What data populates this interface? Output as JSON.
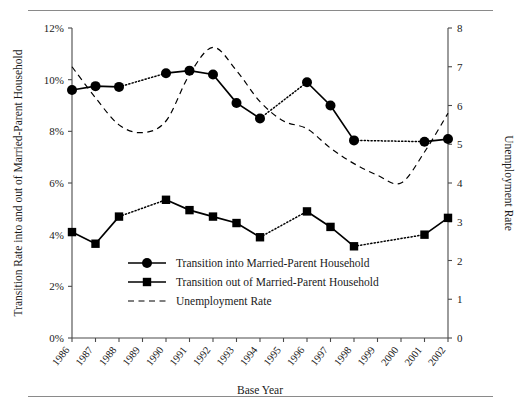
{
  "figure": {
    "has_top_rule": true,
    "has_bottom_rule": true
  },
  "chart_data": {
    "type": "line",
    "title": "",
    "xlabel": "Base Year",
    "ylabel": "Transition Rate into and out of Married-Parent Household",
    "y2label": "Unemployment Rate",
    "categories": [
      "1986",
      "1987",
      "1988",
      "1989",
      "1990",
      "1991",
      "1992",
      "1993",
      "1994",
      "1995",
      "1996",
      "1997",
      "1998",
      "1999",
      "2000",
      "2001",
      "2002"
    ],
    "ylim": [
      0,
      12
    ],
    "yticks": [
      0,
      2,
      4,
      6,
      8,
      10,
      12
    ],
    "ytick_labels": [
      "0%",
      "2%",
      "4%",
      "6%",
      "8%",
      "10%",
      "12%"
    ],
    "y2lim": [
      0,
      8
    ],
    "y2ticks": [
      0,
      1,
      2,
      3,
      4,
      5,
      6,
      7,
      8
    ],
    "y2tick_labels": [
      "0",
      "1",
      "2",
      "3",
      "4",
      "5",
      "6",
      "7",
      "8"
    ],
    "grid": false,
    "legend_position": "inside-lower-center",
    "series": [
      {
        "name": "Transition into Married-Parent Household",
        "axis": "left",
        "marker": "circle",
        "line": "solid",
        "values": [
          9.6,
          9.75,
          9.72,
          null,
          10.25,
          10.35,
          10.2,
          9.1,
          8.5,
          null,
          9.9,
          9.0,
          7.65,
          null,
          null,
          7.6,
          7.7
        ],
        "interpolated_gaps": [
          [
            "1988",
            "1990"
          ],
          [
            "1994",
            "1996"
          ],
          [
            "1998",
            "2001"
          ]
        ]
      },
      {
        "name": "Transition out of Married-Parent Household",
        "axis": "left",
        "marker": "square",
        "line": "solid",
        "values": [
          4.1,
          3.65,
          4.7,
          null,
          5.35,
          4.95,
          4.7,
          4.45,
          3.9,
          null,
          4.9,
          4.3,
          3.55,
          null,
          null,
          4.0,
          4.65
        ],
        "interpolated_gaps": [
          [
            "1994",
            "1996"
          ],
          [
            "1998",
            "2001"
          ]
        ]
      },
      {
        "name": "Unemployment Rate",
        "axis": "right",
        "marker": "none",
        "line": "dashed",
        "values": [
          7.0,
          6.2,
          5.5,
          5.3,
          5.6,
          6.8,
          7.5,
          6.9,
          6.1,
          5.6,
          5.4,
          4.9,
          4.5,
          4.2,
          4.0,
          4.8,
          5.8
        ]
      }
    ],
    "legend": [
      {
        "label": "Transition into Married-Parent Household",
        "marker": "circle",
        "line": "solid"
      },
      {
        "label": "Transition out of Married-Parent Household",
        "marker": "square",
        "line": "solid"
      },
      {
        "label": "Unemployment Rate",
        "marker": "none",
        "line": "dashed"
      }
    ]
  }
}
